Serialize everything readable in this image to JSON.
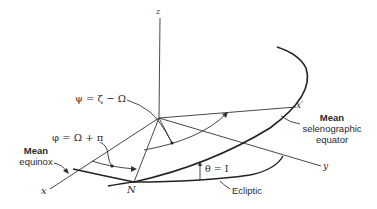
{
  "diagram": {
    "axes": {
      "z": "z",
      "x": "x",
      "y": "y",
      "x_prime": "x′"
    },
    "node_label": "N",
    "angles": {
      "psi": "ψ = ζ − Ω",
      "phi": "φ = Ω + π",
      "theta": "θ = I"
    },
    "callouts": {
      "mean_equinox": [
        "Mean",
        "equinox"
      ],
      "mean_selenographic_equator": [
        "Mean",
        "selenographic",
        "equator"
      ],
      "ecliptic": "Ecliptic"
    },
    "colors": {
      "line": "#333333",
      "text": "#2a2a2a",
      "background": "#ffffff"
    }
  }
}
